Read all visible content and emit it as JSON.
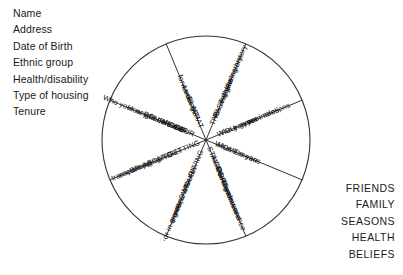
{
  "left_list": {
    "items": [
      "Name",
      "Address",
      "Date of Birth",
      "Ethnic group",
      "Health/disability",
      "Type of housing",
      "Tenure"
    ]
  },
  "right_list": {
    "items": [
      "FRIENDS",
      "FAMILY",
      "SEASONS",
      "HEALTH",
      "BELIEFS"
    ]
  },
  "wheel": {
    "segment_count": 8,
    "segments": [
      {
        "id": "the-past",
        "heading": "THE PAST",
        "lines": [
          "You and your",
          "origins",
          "e.g. life history,",
          "housing history"
        ]
      },
      {
        "id": "you",
        "heading": "YOU",
        "lines": [
          "Who you are",
          "now",
          "e.g. your roles,",
          "your intentions"
        ]
      },
      {
        "id": "home",
        "heading": "HOME",
        "lines": [
          "What it means",
          "to you"
        ]
      },
      {
        "id": "staying-indoors",
        "heading": "STAYING INDOORS",
        "lines": [
          "Routines",
          "Feeling secure",
          "Comfort and",
          "convenience"
        ]
      },
      {
        "id": "living-on-your-own",
        "heading": "LIVING ON YOUR OWN",
        "lines": [
          "-or with another",
          "person",
          "-or in a group"
        ]
      },
      {
        "id": "getting-out-and-about",
        "heading": "GETTING OUT AND ABOUT",
        "lines": [
          "Shopping",
          "socialising",
          "transport"
        ]
      },
      {
        "id": "your-neighbourhood",
        "heading": "YOUR NEIGH- BOURHOOD",
        "lines": [
          "How you define it",
          "Who your neighbours are?"
        ]
      },
      {
        "id": "what-else",
        "heading": "WHAT ELSE?",
        "lines": [
          "Looking",
          "forwards"
        ]
      }
    ]
  }
}
